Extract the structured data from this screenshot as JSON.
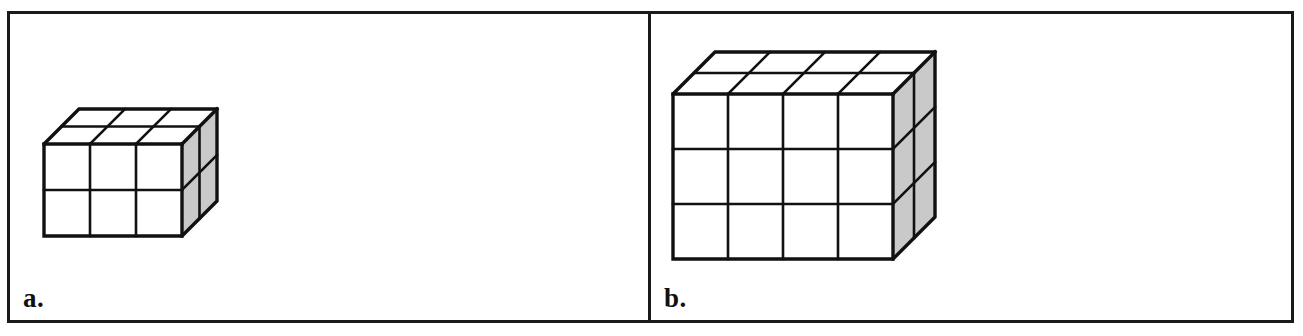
{
  "figure": {
    "background_color": "#ffffff",
    "border_color": "#1a1a1a",
    "front_face_color": "#ffffff",
    "top_face_color": "#ffffff",
    "side_face_color": "#c9c9c9",
    "edge_color": "#111111",
    "scan_artifact_text": "",
    "panels": [
      {
        "id": "a",
        "label": "a.",
        "shape": "rectangular-prism-of-unit-cubes",
        "dimensions": {
          "width": 3,
          "height": 2,
          "depth": 2
        },
        "unit_cube_count": 12,
        "front_face_grid": {
          "columns": 3,
          "rows": 2
        },
        "top_face_grid": {
          "columns": 3,
          "rows": 2
        },
        "side_face_grid": {
          "columns": 2,
          "rows": 2
        },
        "projection": "oblique"
      },
      {
        "id": "b",
        "label": "b.",
        "shape": "rectangular-prism-of-unit-cubes",
        "dimensions": {
          "width": 4,
          "height": 3,
          "depth": 2
        },
        "unit_cube_count": 24,
        "front_face_grid": {
          "columns": 4,
          "rows": 3
        },
        "top_face_grid": {
          "columns": 4,
          "rows": 2
        },
        "side_face_grid": {
          "columns": 2,
          "rows": 3
        },
        "projection": "oblique"
      }
    ]
  }
}
